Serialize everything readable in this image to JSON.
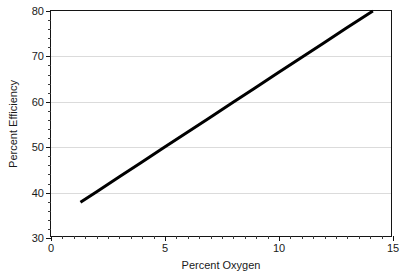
{
  "chart_data": {
    "type": "line",
    "title": "",
    "subtitle": "",
    "xlabel": "Percent Oxygen",
    "ylabel": "Percent Efficiency",
    "xlim": [
      0,
      15
    ],
    "ylim": [
      30,
      80
    ],
    "xticks": [
      0,
      5,
      10,
      15
    ],
    "xtick_labels": [
      "0",
      "5",
      "10",
      "15"
    ],
    "yticks": [
      30,
      40,
      50,
      60,
      70,
      80
    ],
    "ytick_labels": [
      "30",
      "40",
      "50",
      "60",
      "70",
      "80"
    ],
    "x_minor_step": 0.5,
    "y_minor_step": 2,
    "grid": {
      "horizontal": true,
      "vertical": false,
      "at": [
        40,
        50,
        60,
        70
      ],
      "color": "#cfcfcf"
    },
    "legend": {
      "visible": false,
      "position": "none"
    },
    "annotations": [],
    "series": [
      {
        "name": "Efficiency vs Oxygen",
        "style": "solid-line",
        "color": "#000000",
        "line_width_px": 3,
        "markers": false,
        "x": [
          1.3,
          2.0,
          3.0,
          4.0,
          5.0,
          6.0,
          7.0,
          8.0,
          9.0,
          10.0,
          11.0,
          12.0,
          13.0,
          14.2
        ],
        "y": [
          37.5,
          39.8,
          43.1,
          46.4,
          49.7,
          53.0,
          56.3,
          59.6,
          62.9,
          66.2,
          69.5,
          72.8,
          76.1,
          80.0
        ],
        "endpoints": {
          "start": [
            1.3,
            37.5
          ],
          "end": [
            14.2,
            80.0
          ]
        },
        "slope": 3.3,
        "intercept": 33.2
      }
    ]
  },
  "figure": {
    "background": "#ffffff",
    "axis_color": "#141414",
    "text_color": "#1a1a1a"
  }
}
